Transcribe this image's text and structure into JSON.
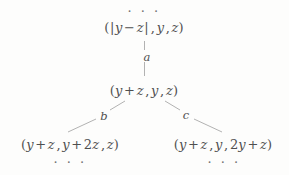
{
  "figure": {
    "background_color": "#fdfdfc",
    "text_color": "#4f4f4f",
    "edge_color": "#a9a9a9"
  },
  "ellipses": {
    "top": "· · ·",
    "bottom_left": "· · ·",
    "bottom_right": "· · ·"
  },
  "nodes": {
    "root": {
      "name": "root-node",
      "parts": {
        "open": "(",
        "bar_open": "|",
        "v1": "y",
        "minus": "−",
        "v2": "z",
        "bar_close": "|",
        "comma1": ",",
        "v3": "y",
        "comma2": ",",
        "v4": "z",
        "close": ")"
      },
      "text": "(|y − z|, y, z)"
    },
    "middle": {
      "name": "middle-node",
      "parts": {
        "open": "(",
        "v1": "y",
        "plus": "+",
        "v2": "z",
        "comma1": ",",
        "v3": "y",
        "comma2": ",",
        "v4": "z",
        "close": ")"
      },
      "text": "(y + z, y, z)"
    },
    "bottom_left": {
      "name": "bottom-left-node",
      "parts": {
        "open": "(",
        "v1": "y",
        "plus1": "+",
        "v2": "z",
        "comma1": ",",
        "v3": "y",
        "plus2": "+",
        "coef": "2",
        "v4": "z",
        "comma2": ",",
        "v5": "z",
        "close": ")"
      },
      "text": "(y + z, y + 2z, z)"
    },
    "bottom_right": {
      "name": "bottom-right-node",
      "parts": {
        "open": "(",
        "v1": "y",
        "plus1": "+",
        "v2": "z",
        "comma1": ",",
        "v3": "y",
        "comma2": ",",
        "coef": "2",
        "v4": "y",
        "plus2": "+",
        "v5": "z",
        "close": ")"
      },
      "text": "(y + z, y, 2y + z)"
    }
  },
  "edges": [
    {
      "name": "edge-a",
      "label": "a",
      "from": "root",
      "to": "middle"
    },
    {
      "name": "edge-b",
      "label": "b",
      "from": "middle",
      "to": "bottom_left"
    },
    {
      "name": "edge-c",
      "label": "c",
      "from": "middle",
      "to": "bottom_right"
    }
  ],
  "edge_labels": {
    "a": "a",
    "b": "b",
    "c": "c"
  }
}
